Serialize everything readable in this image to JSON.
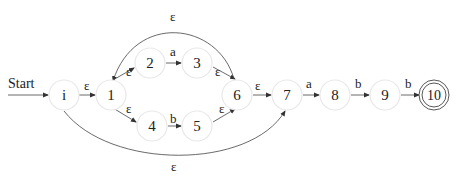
{
  "diagram": {
    "type": "nfa",
    "start_label": "Start",
    "nodes": [
      {
        "id": "i",
        "label": "i",
        "x": 64,
        "y": 95
      },
      {
        "id": "1",
        "label": "1",
        "x": 111,
        "y": 95
      },
      {
        "id": "2",
        "label": "2",
        "x": 150,
        "y": 63
      },
      {
        "id": "3",
        "label": "3",
        "x": 197,
        "y": 63
      },
      {
        "id": "4",
        "label": "4",
        "x": 152,
        "y": 126
      },
      {
        "id": "5",
        "label": "5",
        "x": 197,
        "y": 126
      },
      {
        "id": "6",
        "label": "6",
        "x": 237,
        "y": 95
      },
      {
        "id": "7",
        "label": "7",
        "x": 287,
        "y": 95
      },
      {
        "id": "8",
        "label": "8",
        "x": 335,
        "y": 95
      },
      {
        "id": "9",
        "label": "9",
        "x": 385,
        "y": 95
      },
      {
        "id": "10",
        "label": "10",
        "x": 434,
        "y": 95,
        "accepting": true
      }
    ],
    "edges": [
      {
        "from": "i",
        "to": "1",
        "label": "ε"
      },
      {
        "from": "1",
        "to": "2",
        "label": "ε"
      },
      {
        "from": "2",
        "to": "3",
        "label": "a"
      },
      {
        "from": "3",
        "to": "6",
        "label": "ε"
      },
      {
        "from": "1",
        "to": "4",
        "label": "ε"
      },
      {
        "from": "4",
        "to": "5",
        "label": "b"
      },
      {
        "from": "5",
        "to": "6",
        "label": "ε"
      },
      {
        "from": "6",
        "to": "1",
        "label": "ε"
      },
      {
        "from": "6",
        "to": "7",
        "label": "ε"
      },
      {
        "from": "i",
        "to": "7",
        "label": "ε"
      },
      {
        "from": "7",
        "to": "8",
        "label": "a"
      },
      {
        "from": "8",
        "to": "9",
        "label": "b"
      },
      {
        "from": "9",
        "to": "10",
        "label": "b"
      }
    ]
  }
}
